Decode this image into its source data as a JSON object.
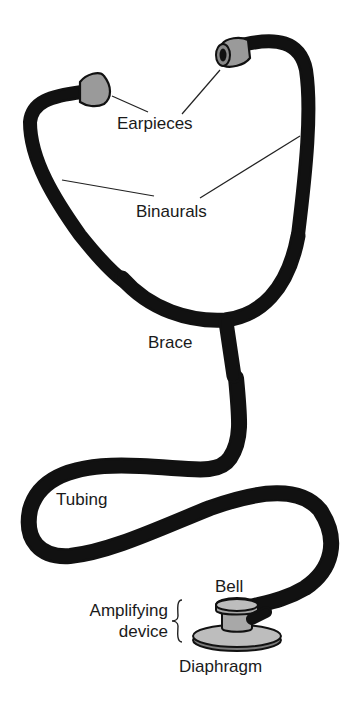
{
  "colors": {
    "outline": "#111111",
    "binaural_fill": "#c9c9c9",
    "brace_fill": "#8f8f8f",
    "tubing_fill": "#b3b3b3",
    "earpiece_fill": "#9a9a9a",
    "background": "#ffffff"
  },
  "labels": {
    "earpieces": "Earpieces",
    "binaurals": "Binaurals",
    "brace": "Brace",
    "tubing": "Tubing",
    "bell": "Bell",
    "amplifying_line1": "Amplifying",
    "amplifying_line2": "device",
    "diaphragm": "Diaphragm"
  },
  "parts": [
    {
      "name": "Earpieces",
      "count": 2
    },
    {
      "name": "Binaurals",
      "count": 2
    },
    {
      "name": "Brace",
      "count": 1
    },
    {
      "name": "Tubing",
      "count": 1
    },
    {
      "name": "Amplifying device",
      "components": [
        "Bell",
        "Diaphragm"
      ]
    }
  ]
}
